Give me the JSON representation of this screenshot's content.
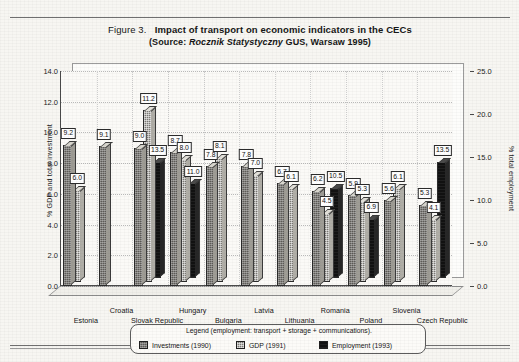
{
  "figure": {
    "number": "Figure 3.",
    "title": "Impact of transport on economic indicators in the CECs",
    "source_prefix": "(Source: ",
    "source_italic": "Rocznik Statystyczny",
    "source_suffix": " GUS, Warsaw 1995)"
  },
  "legend": {
    "caption": "Legend (employment: transport + storage + communications).",
    "items": [
      {
        "label": "Investments (1990)",
        "swatch": "dark-hatch-swatch"
      },
      {
        "label": "GDP (1991)",
        "swatch": "checker-swatch"
      },
      {
        "label": "Employment (1993)",
        "swatch": "black-swatch"
      }
    ]
  },
  "chart_data": {
    "type": "bar",
    "title": "Impact of transport on economic indicators in the CECs",
    "subtitle": "(Source: Rocznik Statystyczny GUS, Warsaw 1995)",
    "xlabel": "",
    "ylabel": "% GDP and total investment",
    "y2label": "% total employment",
    "ylim": [
      0.0,
      14.0
    ],
    "y2lim": [
      0.0,
      25.0
    ],
    "yticks": [
      "0.0",
      "2.0",
      "4.0",
      "6.0",
      "8.0",
      "10.0",
      "12.0",
      "14.0"
    ],
    "y2ticks": [
      "0.0",
      "5.0",
      "10.0",
      "15.0",
      "20.0",
      "25.0"
    ],
    "grid": true,
    "legend_position": "bottom",
    "categories": [
      "Estonia",
      "Croatia",
      "Slovak Republic",
      "Hungary",
      "Bulgaria",
      "Latvia",
      "Lithuania",
      "Romania",
      "Poland",
      "Slovenia",
      "Czech Republic"
    ],
    "series": [
      {
        "name": "Investments (1990)",
        "axis": "left",
        "values": [
          9.2,
          9.1,
          9.0,
          8.7,
          7.8,
          7.8,
          6.7,
          6.2,
          5.9,
          5.6,
          5.3
        ]
      },
      {
        "name": "GDP (1991)",
        "axis": "left",
        "values": [
          6.0,
          null,
          11.2,
          8.0,
          8.1,
          7.0,
          6.1,
          4.5,
          5.3,
          6.1,
          4.1
        ]
      },
      {
        "name": "Employment (1993)",
        "axis": "right",
        "values": [
          null,
          null,
          13.5,
          11.0,
          null,
          null,
          null,
          10.5,
          6.9,
          null,
          13.5
        ]
      }
    ]
  }
}
